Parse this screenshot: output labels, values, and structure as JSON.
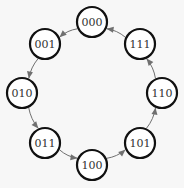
{
  "diagram": {
    "type": "state-transition-cycle",
    "node_radius": 15,
    "colors": {
      "background": "#f7f7f7",
      "node_fill": "#ffffff",
      "node_stroke": "#111111",
      "edge": "#707070",
      "label": "#333333"
    },
    "nodes": [
      {
        "id": "000",
        "label": "000",
        "x": 92,
        "y": 22
      },
      {
        "id": "001",
        "label": "001",
        "x": 45,
        "y": 44
      },
      {
        "id": "010",
        "label": "010",
        "x": 22,
        "y": 93
      },
      {
        "id": "011",
        "label": "011",
        "x": 45,
        "y": 143
      },
      {
        "id": "100",
        "label": "100",
        "x": 92,
        "y": 165
      },
      {
        "id": "101",
        "label": "101",
        "x": 140,
        "y": 143
      },
      {
        "id": "110",
        "label": "110",
        "x": 162,
        "y": 93
      },
      {
        "id": "111",
        "label": "111",
        "x": 140,
        "y": 44
      }
    ],
    "edges": [
      {
        "from": "000",
        "to": "001"
      },
      {
        "from": "001",
        "to": "010"
      },
      {
        "from": "010",
        "to": "011"
      },
      {
        "from": "011",
        "to": "100"
      },
      {
        "from": "100",
        "to": "101"
      },
      {
        "from": "101",
        "to": "110"
      },
      {
        "from": "110",
        "to": "111"
      },
      {
        "from": "111",
        "to": "000"
      }
    ]
  }
}
